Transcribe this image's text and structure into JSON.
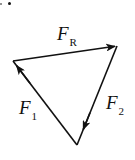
{
  "diagram": {
    "title": "",
    "type": "vector-triangle",
    "stroke_color": "#111111",
    "background": "#ffffff",
    "vertices": {
      "left": [
        13,
        61
      ],
      "top_right": [
        117,
        46
      ],
      "bottom": [
        77,
        145
      ]
    },
    "vectors": [
      {
        "id": "F_R",
        "label_main": "F",
        "label_sub": "R",
        "from": "left",
        "to": "top_right",
        "arrow_at": "end"
      },
      {
        "id": "F_2",
        "label_main": "F",
        "label_sub": "2",
        "from": "top_right",
        "to": "bottom",
        "arrow_at": "end"
      },
      {
        "id": "F_1",
        "label_main": "F",
        "label_sub": "1",
        "from": "bottom",
        "to": "left",
        "arrow_at": "end"
      }
    ],
    "labels": {
      "fr": {
        "main": "F",
        "sub": "R"
      },
      "f1": {
        "main": "F",
        "sub": "1"
      },
      "f2": {
        "main": "F",
        "sub": "2"
      }
    }
  }
}
